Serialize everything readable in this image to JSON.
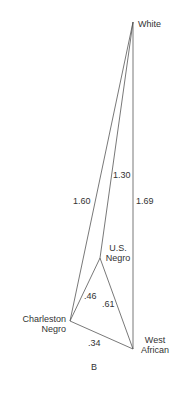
{
  "figure": {
    "panel_label": "B",
    "nodes": [
      {
        "id": "white",
        "label_lines": [
          "White"
        ]
      },
      {
        "id": "us_negro",
        "label_lines": [
          "U.S.",
          "Negro"
        ]
      },
      {
        "id": "charleston_negro",
        "label_lines": [
          "Charleston",
          "Negro"
        ]
      },
      {
        "id": "west_african",
        "label_lines": [
          "West",
          "African"
        ]
      }
    ],
    "edges": [
      {
        "from": "white",
        "to": "charleston_negro",
        "distance": "1.60"
      },
      {
        "from": "white",
        "to": "us_negro",
        "distance": "1.30"
      },
      {
        "from": "white",
        "to": "west_african",
        "distance": "1.69"
      },
      {
        "from": "us_negro",
        "to": "charleston_negro",
        "distance": ".46"
      },
      {
        "from": "us_negro",
        "to": "west_african",
        "distance": ".61"
      },
      {
        "from": "charleston_negro",
        "to": "west_african",
        "distance": ".34"
      }
    ]
  },
  "colors": {
    "line": "#555555",
    "text": "#333333",
    "background": "#ffffff"
  }
}
